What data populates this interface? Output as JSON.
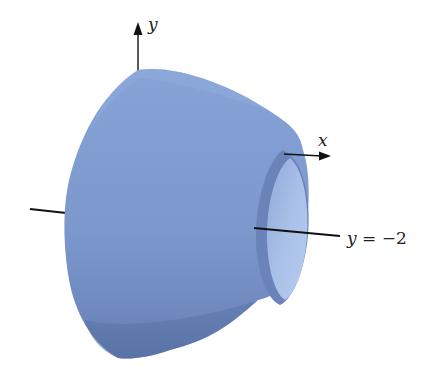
{
  "figure": {
    "solid_color": "#7f9bd0",
    "solid_shadow": "#5f78ad",
    "inner_color": "#a6bde6",
    "axis_color": "#111111",
    "labels": {
      "y_axis": "y",
      "x_axis": "x",
      "rotation_axis_var": "y",
      "rotation_axis_eq": "= −2"
    }
  }
}
